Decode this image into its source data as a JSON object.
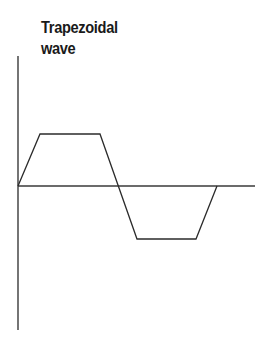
{
  "figure": {
    "title_line1": "Trapezoidal",
    "title_line2": "wave",
    "title_full": "Trapezoidal\nwave",
    "background_color": "#ffffff",
    "line_color": "#2b2b2b",
    "axis_color": "#3a3a3a",
    "title_color": "#1a1a1a"
  },
  "chart_data": {
    "type": "line",
    "title": "Trapezoidal wave",
    "xlabel": "",
    "ylabel": "",
    "grid": false,
    "legend": null,
    "axes": {
      "origin_px": [
        18,
        186
      ],
      "x_axis_from_px": [
        18,
        186
      ],
      "x_axis_to_px": [
        255,
        186
      ],
      "y_axis_from_px": [
        18,
        56
      ],
      "y_axis_to_px": [
        18,
        330
      ],
      "x_tick_labels": [],
      "y_tick_labels": [],
      "xlim": [
        0,
        1.19
      ],
      "ylim": [
        -1.3,
        1.3
      ]
    },
    "series": [
      {
        "name": "Trapezoidal wave",
        "x": [
          0,
          0.11,
          0.41,
          0.6,
          0.89,
          1.0
        ],
        "y": [
          0,
          1,
          1,
          -1,
          -1,
          0
        ],
        "points_px": [
          [
            18,
            186
          ],
          [
            40,
            134
          ],
          [
            100,
            134
          ],
          [
            137,
            239
          ],
          [
            196,
            239
          ],
          [
            217,
            186
          ]
        ],
        "path_d": "M 18 186 L 40 134 L 100 134 L 137 239 L 196 239 L 217 186"
      }
    ],
    "annotations": []
  }
}
